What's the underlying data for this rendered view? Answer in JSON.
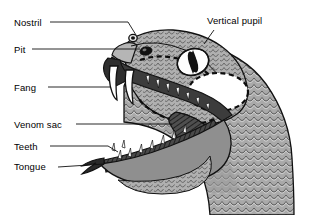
{
  "figure": {
    "style": "black-and-white line illustration with leader-line callouts",
    "background_color": "#ffffff",
    "line_color": "#000000",
    "scale_fill": "#a8a8a8",
    "dark_fill": "#3a3a3a",
    "white_fill": "#ffffff"
  },
  "labels": [
    {
      "id": "nostril",
      "text": "Nostril",
      "x": 14,
      "y": 18,
      "side": "left"
    },
    {
      "id": "pit",
      "text": "Pit",
      "x": 14,
      "y": 45,
      "side": "left"
    },
    {
      "id": "fang",
      "text": "Fang",
      "x": 14,
      "y": 83,
      "side": "left"
    },
    {
      "id": "venom-sac",
      "text": "Venom sac",
      "x": 14,
      "y": 120,
      "side": "left"
    },
    {
      "id": "teeth",
      "text": "Teeth",
      "x": 14,
      "y": 142,
      "side": "left"
    },
    {
      "id": "tongue",
      "text": "Tongue",
      "x": 14,
      "y": 162,
      "side": "left"
    },
    {
      "id": "vertical-pupil",
      "text": "Vertical pupil",
      "x": 207,
      "y": 16,
      "side": "right"
    }
  ],
  "parts": [
    {
      "id": "nostril",
      "description": "small dark circular opening on top of the snout"
    },
    {
      "id": "pit",
      "description": "dark oval heat-sensing pit between nostril and eye"
    },
    {
      "id": "fang",
      "description": "two long curved hollow fangs on the upper jaw"
    },
    {
      "id": "venom-sac",
      "description": "dark hatched triangular venom gland inside the mouth"
    },
    {
      "id": "teeth",
      "description": "rows of small pointed teeth on upper and lower jaws"
    },
    {
      "id": "tongue",
      "description": "forked tongue protruding from the front of the lower jaw"
    },
    {
      "id": "vertical-pupil",
      "description": "large eye with a vertical slit pupil"
    },
    {
      "id": "scales",
      "description": "overlapping scales covering the head and neck"
    }
  ]
}
